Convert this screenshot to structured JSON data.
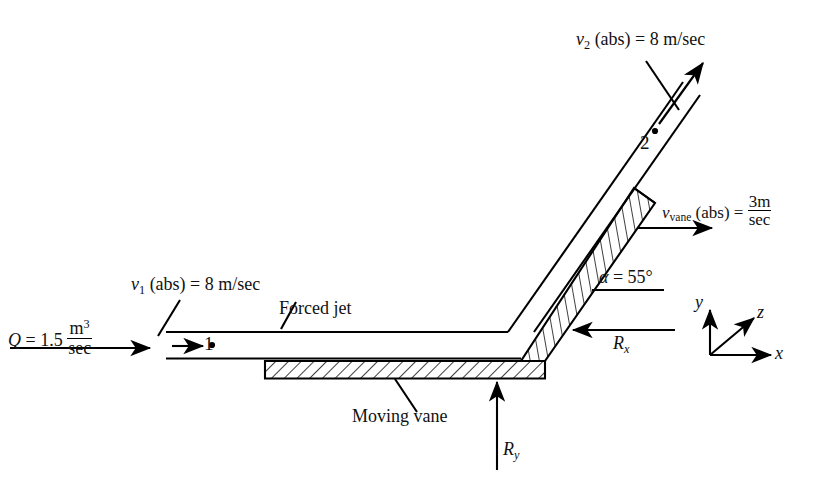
{
  "diagram": {
    "labels": {
      "flow_rate": {
        "symbol": "Q",
        "eq": " = 1.5 ",
        "num": "m",
        "num_sup": "3",
        "den": "sec"
      },
      "v1": {
        "symbol": "v",
        "sub": "1",
        "rest": " (abs) = 8 m/sec"
      },
      "v2": {
        "symbol": "v",
        "sub": "2",
        "rest": " (abs) = 8 m/sec"
      },
      "v_vane": {
        "symbol": "v",
        "sub": "vane",
        "rest": " (abs) = ",
        "num": "3m",
        "den": "sec"
      },
      "forced_jet": "Forced jet",
      "moving_vane": "Moving vane",
      "alpha": {
        "symbol": "α",
        "rest": " = 55°"
      },
      "Rx": {
        "symbol": "R",
        "sub": "x"
      },
      "Ry": {
        "symbol": "R",
        "sub": "y"
      },
      "point1": "1",
      "point2": "2",
      "axis_x": "x",
      "axis_y": "y",
      "axis_z": "z"
    },
    "values": {
      "Q": "1.5 m^3/sec",
      "v1": "8 m/sec",
      "v2": "8 m/sec",
      "v_vane": "3 m/sec",
      "alpha_deg": "55"
    },
    "colors": {
      "ink": "#000000",
      "background": "#ffffff"
    }
  }
}
